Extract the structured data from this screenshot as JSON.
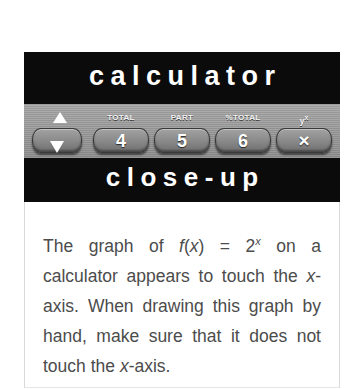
{
  "figure": {
    "masthead_top_word": "calculator",
    "masthead_bottom_word": "close-up",
    "keypad": {
      "keys": [
        {
          "name": "arrow-updown-key",
          "sublabel": "",
          "digit": "",
          "icon": "arrow-up-down-icon"
        },
        {
          "name": "total-4-key",
          "sublabel": "TOTAL",
          "digit": "4",
          "icon": ""
        },
        {
          "name": "part-5-key",
          "sublabel": "PART",
          "digit": "5",
          "icon": ""
        },
        {
          "name": "percent-total-6-key",
          "sublabel": "%TOTAL",
          "digit": "6",
          "icon": ""
        },
        {
          "name": "y-to-the-x-multiply-key",
          "sublabel": "y",
          "sublabel_sup": "x",
          "digit": "×",
          "icon": "multiply-icon"
        }
      ]
    },
    "body": {
      "line1_a": "The graph of ",
      "line1_f": "f",
      "line1_b": "(",
      "line1_x": "x",
      "line1_c": ") = 2",
      "line1_sup": "x",
      "line1_d": " on a calculator appears to touch the ",
      "line3_x": "x",
      "line3_a": "-axis. When drawing this graph by hand, make sure that it does not touch the ",
      "line5_x": "x",
      "line5_end": "-axis."
    }
  },
  "colors": {
    "page_background": "#ffffff",
    "masthead_background": "#0b0b0b",
    "masthead_text": "#ffffff",
    "keypad_background": "#9d9d9d",
    "key_cap": "#8d8d8d",
    "body_text": "#4c4c4c",
    "panel_border": "#d9d9d9"
  }
}
